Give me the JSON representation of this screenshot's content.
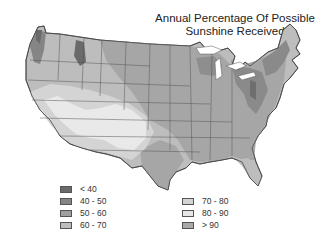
{
  "title": {
    "line1": "Annual Percentage Of Possible",
    "line2": "Sunshine Received"
  },
  "legend": {
    "left": [
      {
        "label": "< 40",
        "color": "#6a6a6a"
      },
      {
        "label": "40 - 50",
        "color": "#858585"
      },
      {
        "label": "50 - 60",
        "color": "#a0a0a0"
      },
      {
        "label": "60 - 70",
        "color": "#bdbdbd"
      }
    ],
    "right": [
      {
        "label": "70 - 80",
        "color": "#d4d4d4"
      },
      {
        "label": "80 - 90",
        "color": "#e6e6e6"
      },
      {
        "label": "> 90",
        "color": "#aaaaaa"
      }
    ]
  },
  "map": {
    "region": "Contiguous United States",
    "border_color": "#444444"
  }
}
